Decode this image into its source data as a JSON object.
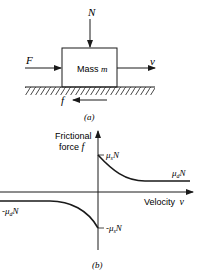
{
  "part_a": {
    "normal_force_label": "N",
    "applied_force_label": "F",
    "mass_label": "Mass",
    "mass_symbol": "m",
    "velocity_label": "v",
    "friction_label": "f",
    "caption": "(a)"
  },
  "part_b": {
    "y_axis_label_line1": "Frictional",
    "y_axis_label_line2": "force",
    "y_axis_symbol": "f",
    "x_axis_label": "Velocity",
    "x_axis_symbol": "v",
    "static_pos_label": "μ",
    "static_pos_sub": "s",
    "static_pos_N": "N",
    "dynamic_pos_label": "μ",
    "dynamic_pos_sub": "d",
    "dynamic_pos_N": "N",
    "static_neg_label": "-μ",
    "static_neg_sub": "s",
    "static_neg_N": "N",
    "dynamic_neg_label": "-μ",
    "dynamic_neg_sub": "d",
    "dynamic_neg_N": "N",
    "caption": "(b)"
  },
  "colors": {
    "ink": "#1a1a1a",
    "background": "#ffffff"
  }
}
